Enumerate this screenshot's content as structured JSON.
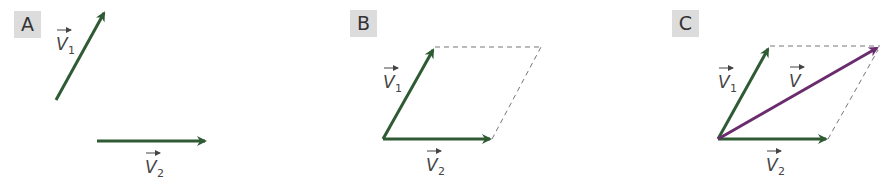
{
  "colors": {
    "component_vector": "#2e5a34",
    "resultant_vector": "#6a2c6e",
    "dashed_line": "#777777",
    "badge_bg": "#dcdcdc"
  },
  "panels": [
    {
      "badge": "A",
      "v1_label": "V",
      "v1_sub": "1",
      "v2_label": "V",
      "v2_sub": "2"
    },
    {
      "badge": "B",
      "v1_label": "V",
      "v1_sub": "1",
      "v2_label": "V",
      "v2_sub": "2"
    },
    {
      "badge": "C",
      "v1_label": "V",
      "v1_sub": "1",
      "v2_label": "V",
      "v2_sub": "2",
      "resultant_label": "V"
    }
  ]
}
